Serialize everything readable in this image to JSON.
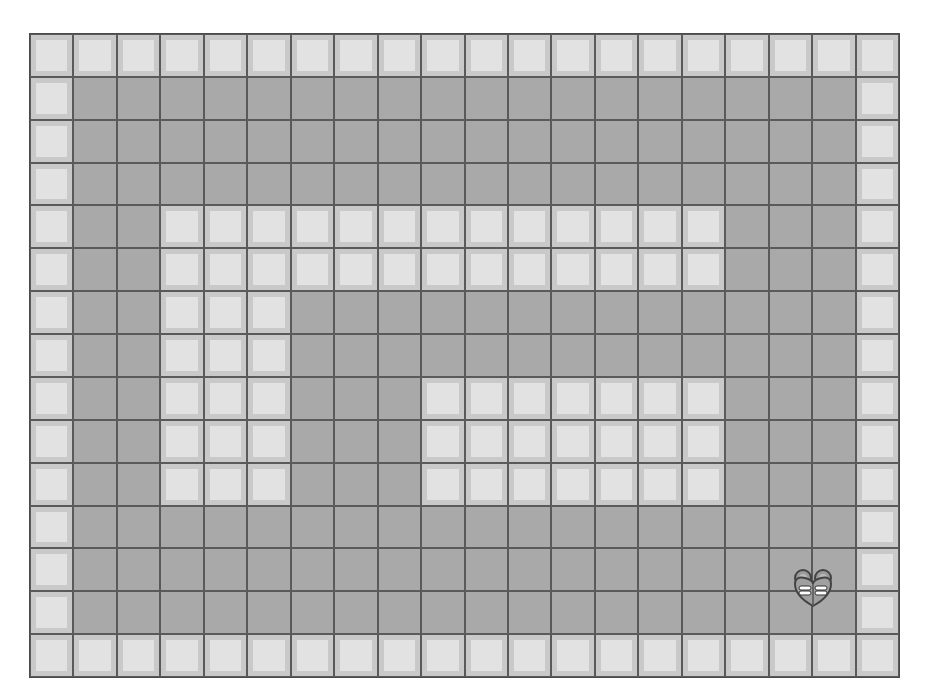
{
  "game": {
    "grid": {
      "columns": 20,
      "rows": 15,
      "legend": {
        "W": "wall",
        ".": "floor"
      },
      "map": [
        "WWWWWWWWWWWWWWWWWWWW",
        "W..................W",
        "W..................W",
        "W..................W",
        "W..WWWWWWWWWWWWW...W",
        "W..WWWWWWWWWWWWW...W",
        "W..WWW.............W",
        "W..WWW.............W",
        "W..WWW...WWWWWWW...W",
        "W..WWW...WWWWWWW...W",
        "W..WWW...WWWWWWW...W",
        "W..................W",
        "W..................W",
        "W..................W",
        "WWWWWWWWWWWWWWWWWWWW"
      ]
    },
    "player": {
      "icon": "heart-bug-character-icon",
      "approx_cell": {
        "col": 17,
        "row": 12
      }
    },
    "colors": {
      "floor": "#a9a9a9",
      "wall_outer": "#c9c9c9",
      "wall_inner": "#e2e2e2",
      "grid_lines": "#5a5a5a"
    }
  }
}
